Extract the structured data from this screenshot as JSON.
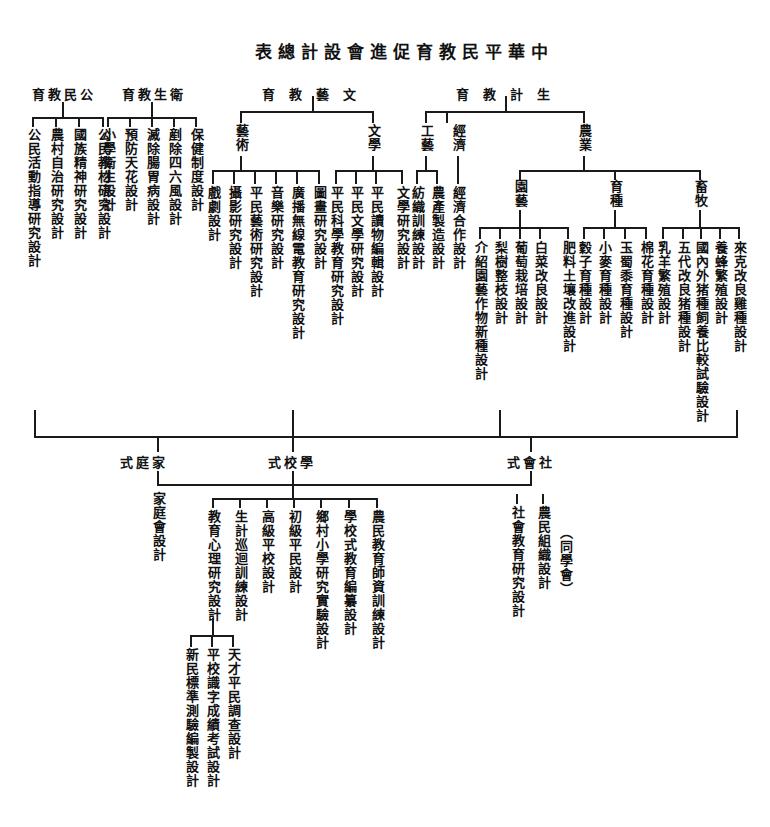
{
  "title": "中華平民教育促進會設計總表",
  "top_branches": [
    {
      "label": "公民教育",
      "children": [
        "公民活動指導研究設計",
        "農村自治研究設計",
        "國族精神研究設計",
        "公民教材研究設計"
      ]
    },
    {
      "label": "衛生教育",
      "children": [
        "小學衛生設計",
        "預防天花設計",
        "滅除腸胃病設計",
        "剷除四六風設計",
        "保健制度設計"
      ]
    },
    {
      "label": "文藝教育",
      "groups": [
        {
          "label": "藝術",
          "children": [
            "戲劇設計",
            "攝影研究設計",
            "平民藝術研究設計",
            "音樂研究設計",
            "廣播無線電教育研究設計",
            "圖畫研究設計"
          ]
        },
        {
          "label": "文學",
          "children": [
            "平民科學教育研究設計",
            "平民文學研究設計",
            "平民讀物編輯設計",
            "文學研究設計"
          ]
        }
      ]
    },
    {
      "label": "生計教育",
      "groups": [
        {
          "label": "工藝",
          "children": [
            "紡織訓練設計",
            "農產製造設計"
          ]
        },
        {
          "label": "經濟",
          "children": [
            "經濟合作設計"
          ]
        },
        {
          "label": "農業",
          "groups": [
            {
              "label": "園藝",
              "children": [
                "介紹園藝作物新種設計",
                "梨樹整枝設計",
                "葡萄栽培設計",
                "白菜改良設計",
                "肥料土壤改進設計"
              ]
            },
            {
              "label": "育種",
              "children": [
                "穀子育種設計",
                "小麥育種設計",
                "玉蜀黍育種設計",
                "棉花育種設計"
              ]
            },
            {
              "label": "畜牧",
              "children": [
                "乳羊繁殖設計",
                "五代改良猪種設計",
                "國內外猪種飼養比較試驗設計",
                "養蜂繁殖設計",
                "來克改良雞種設計"
              ]
            }
          ]
        }
      ]
    }
  ],
  "bottom_branches": [
    {
      "label": "家庭式",
      "children": [
        "家庭會設計"
      ]
    },
    {
      "label": "學校式",
      "children": [
        "教育心理研究設計",
        "生計巡迴訓練設計",
        "高級平校設計",
        "初級平民設計",
        "鄉村小學研究實驗設計",
        "學校式教育編纂設計",
        "農民教育師資訓練設計"
      ],
      "sub": {
        "parent": "教育心理研究設計",
        "children": [
          "新民標準測驗編製設計",
          "平校識字成績考試設計",
          "天才平民調查設計"
        ]
      }
    },
    {
      "label": "社會式",
      "children": [
        "社會教育研究設計",
        "農民組織設計"
      ],
      "note": "（同學會）"
    }
  ]
}
